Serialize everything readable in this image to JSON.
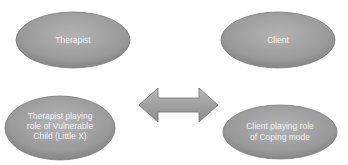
{
  "diagram": {
    "nodes": [
      {
        "id": "therapist",
        "lines": [
          "Therapist"
        ]
      },
      {
        "id": "client",
        "lines": [
          "Client"
        ]
      },
      {
        "id": "therapist-vulnerable-child",
        "lines": [
          "Therapist playing",
          "role of Vulnerable",
          "Child (Little X)"
        ]
      },
      {
        "id": "client-coping-mode",
        "lines": [
          "Client playing role",
          "of Coping mode"
        ]
      }
    ],
    "connector": {
      "type": "double-arrow",
      "from": "left",
      "to": "right"
    }
  }
}
